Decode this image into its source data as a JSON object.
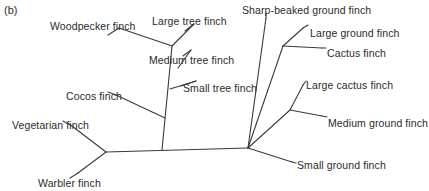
{
  "figure": {
    "panel_label": "(b)",
    "type": "phylogenetic-tree",
    "orientation": "unrooted-horizontal",
    "line_color": "#3a3a3a",
    "text_color": "#2b2b2b",
    "background_color": "#ffffff"
  },
  "tips": [
    {
      "id": "woodpecker-finch",
      "label": "Woodpecker finch",
      "label_x": 50,
      "label_y": 20,
      "anchor": "start"
    },
    {
      "id": "large-tree-finch",
      "label": "Large tree finch",
      "label_x": 152,
      "label_y": 15,
      "anchor": "start"
    },
    {
      "id": "medium-tree-finch",
      "label": "Medium tree finch",
      "label_x": 149,
      "label_y": 54,
      "anchor": "start"
    },
    {
      "id": "small-tree-finch",
      "label": "Small tree finch",
      "label_x": 183,
      "label_y": 82,
      "anchor": "start"
    },
    {
      "id": "cocos-finch",
      "label": "Cocos finch",
      "label_x": 66,
      "label_y": 90,
      "anchor": "start"
    },
    {
      "id": "vegetarian-finch",
      "label": "Vegetarian finch",
      "label_x": 12,
      "label_y": 119,
      "anchor": "start"
    },
    {
      "id": "warbler-finch",
      "label": "Warbler finch",
      "label_x": 38,
      "label_y": 177,
      "anchor": "start"
    },
    {
      "id": "sharp-beaked-ground-finch",
      "label": "Sharp-beaked ground finch",
      "label_x": 242,
      "label_y": 4,
      "anchor": "start"
    },
    {
      "id": "large-ground-finch",
      "label": "Large ground finch",
      "label_x": 310,
      "label_y": 27,
      "anchor": "start"
    },
    {
      "id": "cactus-finch",
      "label": "Cactus finch",
      "label_x": 327,
      "label_y": 47,
      "anchor": "start"
    },
    {
      "id": "large-cactus-finch",
      "label": "Large cactus finch",
      "label_x": 306,
      "label_y": 79,
      "anchor": "start"
    },
    {
      "id": "medium-ground-finch",
      "label": "Medium ground finch",
      "label_x": 328,
      "label_y": 117,
      "anchor": "start"
    },
    {
      "id": "small-ground-finch",
      "label": "Small ground finch",
      "label_x": 297,
      "label_y": 159,
      "anchor": "start"
    }
  ],
  "tree_geometry": {
    "nodes": {
      "root_left": {
        "x": 106,
        "y": 152
      },
      "root_right": {
        "x": 248,
        "y": 148
      },
      "tree_node_a": {
        "x": 162,
        "y": 115
      },
      "tree_node_b": {
        "x": 170,
        "y": 88
      },
      "tree_node_c": {
        "x": 180,
        "y": 68
      },
      "tree_node_d": {
        "x": 172,
        "y": 46
      },
      "ground_node": {
        "x": 283,
        "y": 46
      },
      "cactus_node": {
        "x": 290,
        "y": 110
      }
    },
    "branches": [
      {
        "name": "trunk",
        "from": [
          106,
          152
        ],
        "to": [
          248,
          148
        ]
      },
      {
        "name": "vegetarian-branch",
        "from": [
          106,
          152
        ],
        "to": [
          72,
          126
        ]
      },
      {
        "name": "warbler-branch",
        "from": [
          106,
          152
        ],
        "to": [
          78,
          173
        ]
      },
      {
        "name": "tree-spine-lower",
        "from": [
          162,
          150
        ],
        "to": [
          172,
          46
        ]
      },
      {
        "name": "cocos-branch",
        "from": [
          165,
          118
        ],
        "to": [
          116,
          95
        ]
      },
      {
        "name": "woodpecker-branch",
        "from": [
          172,
          46
        ],
        "to": [
          119,
          28
        ]
      },
      {
        "name": "large-tree-branch",
        "from": [
          172,
          46
        ],
        "to": [
          194,
          24
        ]
      },
      {
        "name": "medium-tree-branch",
        "from": [
          178,
          68
        ],
        "to": [
          191,
          50
        ]
      },
      {
        "name": "small-tree-branch",
        "from": [
          170,
          89
        ],
        "to": [
          196,
          81
        ]
      },
      {
        "name": "sharp-beaked-branch",
        "from": [
          248,
          148
        ],
        "to": [
          266,
          18
        ]
      },
      {
        "name": "ground-spine",
        "from": [
          248,
          148
        ],
        "to": [
          283,
          46
        ]
      },
      {
        "name": "large-ground-branch",
        "from": [
          283,
          46
        ],
        "to": [
          303,
          28
        ]
      },
      {
        "name": "cactus-branch",
        "from": [
          283,
          46
        ],
        "to": [
          322,
          48
        ]
      },
      {
        "name": "cactus-spine",
        "from": [
          248,
          148
        ],
        "to": [
          290,
          110
        ]
      },
      {
        "name": "large-cactus-branch",
        "from": [
          290,
          110
        ],
        "to": [
          303,
          85
        ]
      },
      {
        "name": "medium-ground-branch",
        "from": [
          290,
          110
        ],
        "to": [
          322,
          116
        ]
      },
      {
        "name": "small-ground-branch",
        "from": [
          248,
          148
        ],
        "to": [
          292,
          162
        ]
      }
    ],
    "leaders": [
      {
        "name": "woodpecker-leader",
        "from": [
          119,
          28
        ],
        "to": [
          108,
          35
        ]
      },
      {
        "name": "large-tree-leader",
        "from": [
          194,
          24
        ],
        "to": [
          185,
          31
        ]
      },
      {
        "name": "medium-tree-leader",
        "from": [
          191,
          50
        ],
        "to": [
          183,
          56
        ]
      },
      {
        "name": "small-tree-leader",
        "from": [
          196,
          81
        ],
        "to": [
          181,
          86
        ]
      },
      {
        "name": "cocos-leader",
        "from": [
          116,
          95
        ],
        "to": [
          108,
          92
        ]
      },
      {
        "name": "vegetarian-leader",
        "from": [
          72,
          126
        ],
        "to": [
          63,
          121
        ]
      },
      {
        "name": "warbler-leader",
        "from": [
          78,
          173
        ],
        "to": [
          70,
          178
        ]
      },
      {
        "name": "sharp-beaked-leader",
        "from": [
          266,
          18
        ],
        "to": [
          266,
          13
        ]
      },
      {
        "name": "large-ground-leader",
        "from": [
          303,
          28
        ],
        "to": [
          308,
          25
        ]
      },
      {
        "name": "cactus-leader",
        "from": [
          322,
          48
        ],
        "to": [
          326,
          48
        ]
      },
      {
        "name": "large-cactus-leader",
        "from": [
          303,
          85
        ],
        "to": [
          306,
          81
        ]
      },
      {
        "name": "medium-ground-leader",
        "from": [
          322,
          116
        ],
        "to": [
          327,
          117
        ]
      },
      {
        "name": "small-ground-leader",
        "from": [
          292,
          162
        ],
        "to": [
          296,
          163
        ]
      }
    ]
  }
}
